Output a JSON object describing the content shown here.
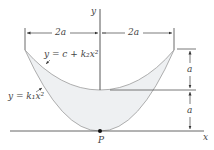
{
  "diagram": {
    "axes": {
      "x_label": "x",
      "y_label": "y"
    },
    "dimensions": {
      "left_width": "2a",
      "right_width": "2a",
      "upper_height": "a",
      "lower_height": "a"
    },
    "curves": {
      "upper": "y = c + k₂x²",
      "lower": "y = k₁x²"
    },
    "point": "P",
    "colors": {
      "line": "#555555",
      "fill": "#eef0f2",
      "curve": "#9a9a9a"
    }
  }
}
